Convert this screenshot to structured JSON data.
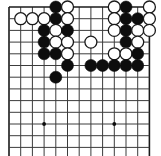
{
  "figure": {
    "kind": "go-board-diagram",
    "caption": ""
  },
  "board": {
    "origin_x": 9,
    "origin_y": 7,
    "spacing": 11.7,
    "cols": 13,
    "rows": 13,
    "line_color": "#3c3c3c",
    "border_color": "#1a1a1a",
    "background_color": "#ffffff",
    "line_width": 1,
    "border_width": 1.6,
    "stone_radius": 6.0,
    "hoshi_radius": 1.9,
    "hoshi": [
      {
        "col": 3,
        "row": 10
      },
      {
        "col": 9,
        "row": 10
      }
    ]
  },
  "colors": {
    "black_stone": "#0d0d0d",
    "white_stone": "#ffffff",
    "stone_outline": "#1a1a1a",
    "grid": "#3c3c3c",
    "page_background": "#ffffff"
  },
  "stones": [
    {
      "col": 4,
      "row": 0,
      "color": "black"
    },
    {
      "col": 5,
      "row": 0,
      "color": "white"
    },
    {
      "col": 9,
      "row": 0,
      "color": "white"
    },
    {
      "col": 10,
      "row": 0,
      "color": "black"
    },
    {
      "col": 12,
      "row": 0,
      "color": "white"
    },
    {
      "col": 1,
      "row": 1,
      "color": "white"
    },
    {
      "col": 2,
      "row": 1,
      "color": "white"
    },
    {
      "col": 3,
      "row": 1,
      "color": "white"
    },
    {
      "col": 4,
      "row": 1,
      "color": "black"
    },
    {
      "col": 5,
      "row": 1,
      "color": "white"
    },
    {
      "col": 9,
      "row": 1,
      "color": "white"
    },
    {
      "col": 10,
      "row": 1,
      "color": "black"
    },
    {
      "col": 11,
      "row": 1,
      "color": "black"
    },
    {
      "col": 12,
      "row": 1,
      "color": "white"
    },
    {
      "col": 3,
      "row": 2,
      "color": "black"
    },
    {
      "col": 4,
      "row": 2,
      "color": "white"
    },
    {
      "col": 5,
      "row": 2,
      "color": "black"
    },
    {
      "col": 9,
      "row": 2,
      "color": "white"
    },
    {
      "col": 10,
      "row": 2,
      "color": "black"
    },
    {
      "col": 11,
      "row": 2,
      "color": "white"
    },
    {
      "col": 12,
      "row": 2,
      "color": "white"
    },
    {
      "col": 3,
      "row": 3,
      "color": "black"
    },
    {
      "col": 4,
      "row": 3,
      "color": "white"
    },
    {
      "col": 5,
      "row": 3,
      "color": "white"
    },
    {
      "col": 7,
      "row": 3,
      "color": "white"
    },
    {
      "col": 10,
      "row": 3,
      "color": "black"
    },
    {
      "col": 11,
      "row": 3,
      "color": "white"
    },
    {
      "col": 3,
      "row": 4,
      "color": "black"
    },
    {
      "col": 4,
      "row": 4,
      "color": "black"
    },
    {
      "col": 5,
      "row": 4,
      "color": "white"
    },
    {
      "col": 9,
      "row": 4,
      "color": "white"
    },
    {
      "col": 10,
      "row": 4,
      "color": "white"
    },
    {
      "col": 11,
      "row": 4,
      "color": "black"
    },
    {
      "col": 5,
      "row": 5,
      "color": "black"
    },
    {
      "col": 7,
      "row": 5,
      "color": "black"
    },
    {
      "col": 8,
      "row": 5,
      "color": "black"
    },
    {
      "col": 9,
      "row": 5,
      "color": "black"
    },
    {
      "col": 10,
      "row": 5,
      "color": "black"
    },
    {
      "col": 11,
      "row": 5,
      "color": "black"
    },
    {
      "col": 4,
      "row": 6,
      "color": "black"
    }
  ]
}
